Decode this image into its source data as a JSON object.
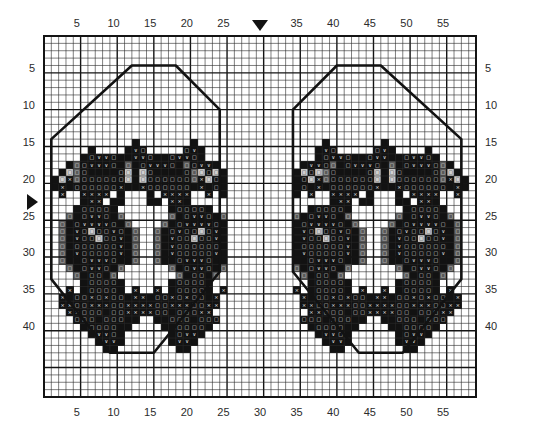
{
  "chart_data": {
    "type": "heatmap",
    "title": "",
    "subtitle": "",
    "xlabel": "",
    "ylabel": "",
    "grid": true,
    "legend_position": "none",
    "columns": 59,
    "rows": 49,
    "xlim": [
      1,
      59
    ],
    "ylim": [
      1,
      49
    ],
    "x_tick_labels": [
      "5",
      "10",
      "15",
      "20",
      "25",
      "35",
      "40",
      "45",
      "50",
      "55"
    ],
    "x_tick_values": [
      5,
      10,
      15,
      20,
      25,
      35,
      40,
      45,
      50,
      55
    ],
    "y_tick_labels": [
      "5",
      "10",
      "15",
      "20",
      "25",
      "30",
      "35",
      "40"
    ],
    "y_tick_values": [
      5,
      10,
      15,
      20,
      25,
      30,
      35,
      40
    ],
    "center_marker_column": 30,
    "center_marker_row": 23,
    "minor_gridline_every": 1,
    "major_gridline_every": 5,
    "palette": {
      "blank": "#ffffff",
      "dark": "#121212",
      "mid": "#5a5a5a",
      "light": "#cfcfcf",
      "gridline_minor": "#2a2a2a",
      "gridline_major": "#141414",
      "outline": "#121212"
    },
    "symbol_legend": [
      {
        "key": "x",
        "glyph": "×",
        "name": "cross-symbol"
      },
      {
        "key": "v",
        "glyph": "∨",
        "name": "vee-symbol"
      },
      {
        "key": "o",
        "glyph": "□",
        "name": "square-symbol"
      },
      {
        "key": "f",
        "glyph": "",
        "name": "filled-cell"
      }
    ],
    "motif_outline_points": [
      [
        2,
        15
      ],
      [
        13,
        5
      ],
      [
        19,
        5
      ],
      [
        25,
        11
      ],
      [
        25,
        33
      ],
      [
        16,
        44
      ],
      [
        10,
        44
      ],
      [
        2,
        34
      ]
    ],
    "motif_outline_mirrored": true
  },
  "axes": {
    "top_ticks": [
      "5",
      "10",
      "15",
      "20",
      "25",
      "35",
      "40",
      "45",
      "50",
      "55"
    ],
    "bottom_ticks": [
      "5",
      "10",
      "15",
      "20",
      "25",
      "30",
      "35",
      "40",
      "45",
      "50",
      "55"
    ],
    "left_ticks": [
      "5",
      "10",
      "15",
      "20",
      "25",
      "30",
      "35",
      "40"
    ],
    "right_ticks": [
      "5",
      "10",
      "15",
      "20",
      "25",
      "30",
      "35",
      "40"
    ]
  },
  "markers": {
    "top_center_arrow": "down-triangle-marker",
    "left_center_arrow": "right-triangle-marker"
  }
}
